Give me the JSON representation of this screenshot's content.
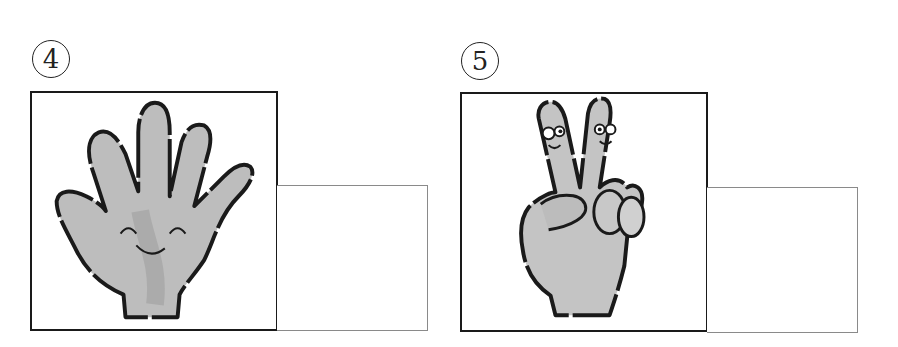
{
  "items": [
    {
      "number": "4",
      "picture": "open-hand-five-fingers-smiling",
      "answer_value": ""
    },
    {
      "number": "5",
      "picture": "peace-sign-two-fingers-with-faces",
      "answer_value": ""
    }
  ],
  "colors": {
    "outline": "#1a1a1a",
    "skin_light": "#c8c8c8",
    "skin_dark": "#9a9a9a",
    "answer_border": "#8a8a8a"
  }
}
